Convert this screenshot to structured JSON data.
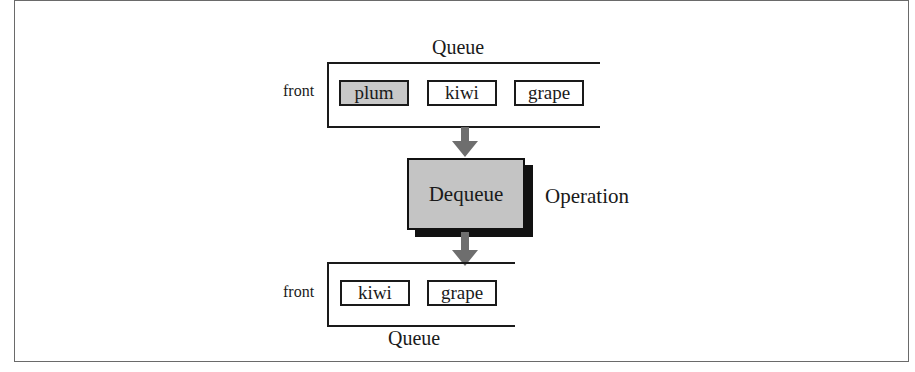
{
  "diagram": {
    "before": {
      "label": "Queue",
      "front_label": "front",
      "items": [
        {
          "value": "plum",
          "highlighted": true
        },
        {
          "value": "kiwi",
          "highlighted": false
        },
        {
          "value": "grape",
          "highlighted": false
        }
      ]
    },
    "operation": {
      "name": "Dequeue",
      "label": "Operation"
    },
    "after": {
      "label": "Queue",
      "front_label": "front",
      "items": [
        {
          "value": "kiwi",
          "highlighted": false
        },
        {
          "value": "grape",
          "highlighted": false
        }
      ]
    },
    "colors": {
      "highlight_fill": "#c8c8c8",
      "operation_fill": "#c4c4c4",
      "arrow": "#6e6e6e",
      "stroke": "#1a1a1a"
    }
  }
}
